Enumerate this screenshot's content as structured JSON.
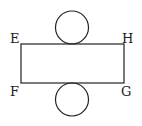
{
  "diagram": {
    "type": "net-of-cylinder",
    "labels": {
      "top_left": "E",
      "top_right": "H",
      "bottom_left": "F",
      "bottom_right": "G"
    },
    "rectangle": {
      "x": 21,
      "y": 44,
      "width": 103,
      "height": 39
    },
    "circles": [
      {
        "name": "top",
        "cx": 72,
        "cy": 27.5,
        "r": 16.5
      },
      {
        "name": "bottom",
        "cx": 72,
        "cy": 99.5,
        "r": 16.5
      }
    ],
    "stroke_color": "#222222"
  }
}
